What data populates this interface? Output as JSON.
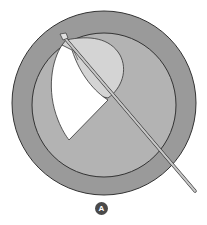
{
  "figure": {
    "type": "surgical-illustration",
    "panel_label": "A",
    "colors": {
      "background": "#ffffff",
      "outer_ring": "#9a9a9a",
      "inner_disc": "#b3b3b3",
      "flap_fold": "#d4d4d4",
      "capsule_opening": "#ffffff",
      "outline": "#333333",
      "instrument": "#c8c8c8",
      "badge": "#4a4a4a"
    },
    "outer_circle": {
      "cx": 104,
      "cy": 103,
      "r": 92
    },
    "inner_circle": {
      "cx": 104,
      "cy": 105,
      "r": 72
    },
    "instrument": {
      "tip": [
        62,
        35
      ],
      "end": [
        195,
        190
      ]
    }
  }
}
